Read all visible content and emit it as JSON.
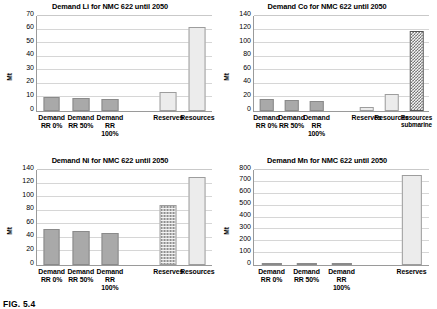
{
  "figure": {
    "caption": "FIG. 5.4"
  },
  "chart_data": [
    {
      "type": "bar",
      "id": "demand-li",
      "title": "Demand Li for NMC 622 until 2050",
      "xlabel": "",
      "ylabel": "Mt",
      "ylim": [
        0,
        70
      ],
      "yticks": [
        0,
        10,
        20,
        30,
        40,
        50,
        60,
        70
      ],
      "grid": true,
      "legend": "none",
      "categories": [
        "Demand\nRR 0%",
        "Demand\nRR 50%",
        "Demand\nRR 100%",
        "",
        "Reserves",
        "Resources"
      ],
      "values": [
        10,
        9.7,
        9.2,
        null,
        14,
        62
      ],
      "fills": [
        "solid-gray",
        "solid-gray",
        "solid-gray",
        null,
        "light",
        "light"
      ]
    },
    {
      "type": "bar",
      "id": "demand-co",
      "title": "Demand Co for NMC 622 until 2050",
      "xlabel": "",
      "ylabel": "Mt",
      "ylim": [
        0,
        140
      ],
      "yticks": [
        0,
        20,
        40,
        60,
        80,
        100,
        120,
        140
      ],
      "grid": true,
      "legend": "none",
      "categories": [
        "Demand\nRR 0%",
        "Demand\nRR 50%",
        "Demand\nRR 100%",
        "",
        "Reserves",
        "Resources",
        "Resources\nsubmarine"
      ],
      "values": [
        17,
        16,
        15,
        null,
        5.5,
        25,
        118
      ],
      "fills": [
        "solid-gray",
        "solid-gray",
        "solid-gray",
        null,
        "light",
        "light",
        "checker"
      ]
    },
    {
      "type": "bar",
      "id": "demand-ni",
      "title": "Demand Ni for NMC 622 until 2050",
      "xlabel": "",
      "ylabel": "Mt",
      "ylim": [
        0,
        140
      ],
      "yticks": [
        0,
        20,
        40,
        60,
        80,
        100,
        120,
        140
      ],
      "grid": true,
      "legend": "none",
      "categories": [
        "Demand\nRR 0%",
        "Demand\nRR 50%",
        "Demand\nRR 100%",
        "",
        "Reserves",
        "Resources"
      ],
      "values": [
        53,
        50,
        47,
        null,
        89,
        130
      ],
      "fills": [
        "solid-gray",
        "solid-gray",
        "solid-gray",
        null,
        "dotted",
        "light"
      ]
    },
    {
      "type": "bar",
      "id": "demand-mn",
      "title": "Demand Mn for NMC 622 until 2050",
      "xlabel": "",
      "ylabel": "Mt",
      "ylim": [
        0,
        800
      ],
      "yticks": [
        0,
        100,
        200,
        300,
        400,
        500,
        600,
        700,
        800
      ],
      "grid": true,
      "legend": "none",
      "categories": [
        "Demand\nRR 0%",
        "Demand\nRR 50%",
        "Demand\nRR 100%",
        "",
        "Reserves"
      ],
      "values": [
        8,
        7,
        6,
        null,
        757
      ],
      "fills": [
        "solid-gray",
        "solid-gray",
        "solid-gray",
        null,
        "light"
      ]
    }
  ]
}
